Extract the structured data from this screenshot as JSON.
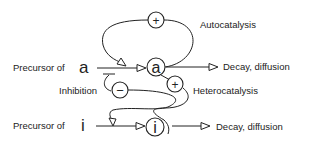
{
  "diagram": {
    "type": "activator-inhibitor reaction scheme",
    "nodes": {
      "activator": {
        "symbol": "a"
      },
      "inhibitor": {
        "symbol": "i"
      },
      "autocatalysis_sign": {
        "symbol": "+"
      },
      "heterocatalysis_sign": {
        "symbol": "+"
      },
      "inhibition_sign": {
        "symbol": "−"
      }
    },
    "labels": {
      "precursor_a_prefix": "Precursor of",
      "precursor_a_symbol": "a",
      "precursor_i_prefix": "Precursor of",
      "precursor_i_symbol": "i",
      "autocatalysis": "Autocatalysis",
      "heterocatalysis": "Heterocatalysis",
      "inhibition": "Inhibition",
      "decay_a": "Decay, diffusion",
      "decay_i": "Decay, diffusion"
    },
    "edges": [
      {
        "from": "precursor_a",
        "to": "a",
        "kind": "production"
      },
      {
        "from": "a",
        "to": "decay_a",
        "kind": "decay"
      },
      {
        "from": "a",
        "to": "a",
        "via": "+",
        "kind": "autocatalysis"
      },
      {
        "from": "a",
        "to": "i",
        "via": "+",
        "kind": "heterocatalysis"
      },
      {
        "from": "i",
        "to": "precursor_a_arrow",
        "via": "−",
        "kind": "inhibition"
      },
      {
        "from": "precursor_i",
        "to": "i",
        "kind": "production"
      },
      {
        "from": "i",
        "to": "decay_i",
        "kind": "decay"
      }
    ]
  }
}
